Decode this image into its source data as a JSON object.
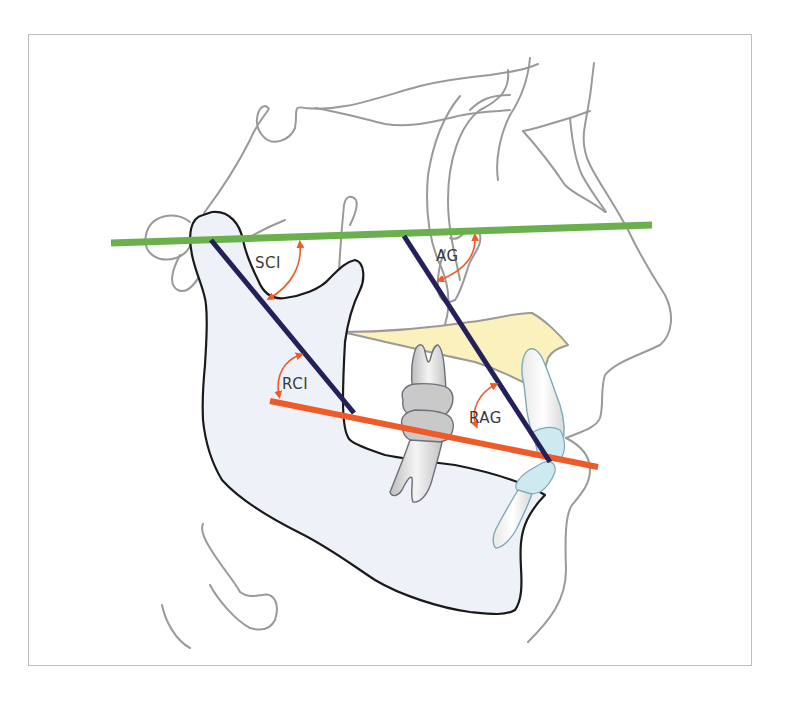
{
  "figure": {
    "type": "cephalometric tracing"
  },
  "colors": {
    "reference_plane_upper": "#6ab04c",
    "reference_plane_lower": "#f05a28",
    "axis_lines": "#23205a",
    "angle_arcs": "#f05a28",
    "bone_outline": "#1a1a1a",
    "soft_tissue_outline": "#9a9a9a",
    "mandible_fill": "#eef2f8",
    "palate_fill": "#faf1bd",
    "incisor_fill": "#cfe9f1",
    "molar_fill": "#d9d9d9",
    "frame_border": "#bdbdbd"
  },
  "lines": [
    {
      "name": "upper-reference-plane",
      "color": "green",
      "from": [
        111,
        243
      ],
      "to": [
        652,
        225
      ]
    },
    {
      "name": "lower-reference-plane",
      "color": "orange",
      "from": [
        270,
        401
      ],
      "to": [
        598,
        467
      ]
    },
    {
      "name": "condylar-ramus-axis",
      "color": "dark-blue",
      "from": [
        211,
        240
      ],
      "to": [
        354,
        413
      ]
    },
    {
      "name": "anterior-axis",
      "color": "dark-blue",
      "from": [
        404,
        236
      ],
      "to": [
        550,
        462
      ]
    }
  ],
  "labels": {
    "sci": "SCI",
    "ag": "AG",
    "rci": "RCI",
    "rag": "RAG"
  },
  "angles": [
    {
      "label": "SCI",
      "between": [
        "upper-reference-plane",
        "condylar-ramus-axis"
      ]
    },
    {
      "label": "AG",
      "between": [
        "upper-reference-plane",
        "anterior-axis"
      ]
    },
    {
      "label": "RCI",
      "between": [
        "lower-reference-plane",
        "condylar-ramus-axis"
      ]
    },
    {
      "label": "RAG",
      "between": [
        "lower-reference-plane",
        "anterior-axis"
      ]
    }
  ]
}
